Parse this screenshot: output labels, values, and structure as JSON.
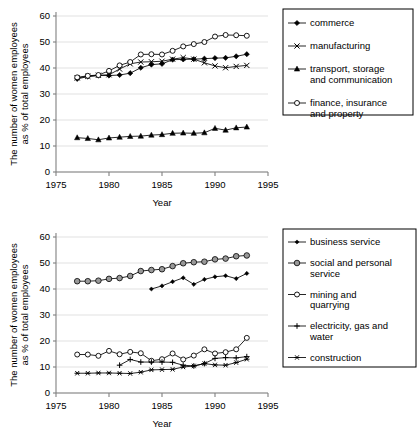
{
  "figure": {
    "axis": {
      "ylabel_line1": "The number of women employees",
      "ylabel_line2": "as % of total employees",
      "xlabel": "Year",
      "yticks": [
        "0",
        "10",
        "20",
        "30",
        "40",
        "50",
        "60"
      ],
      "xticks": [
        "1975",
        "1980",
        "1985",
        "1990",
        "1995"
      ],
      "ylim": [
        0,
        60
      ],
      "xlim": [
        1975,
        1995
      ]
    },
    "colors": {
      "line": "#000000",
      "grid": "#d9d9d9",
      "axis": "#808080",
      "gray_marker": "#999999",
      "open_marker": "#ffffff",
      "legend_border": "#000000"
    }
  },
  "chart_data": [
    {
      "type": "line",
      "title": "",
      "xlabel": "Year",
      "ylabel": "The number of women employees as % of total employees",
      "xlim": [
        1975,
        1995
      ],
      "ylim": [
        0,
        60
      ],
      "grid": true,
      "legend_position": "right",
      "x": [
        1977,
        1978,
        1979,
        1980,
        1981,
        1982,
        1983,
        1984,
        1985,
        1986,
        1987,
        1988,
        1989,
        1990,
        1991,
        1992,
        1993
      ],
      "series": [
        {
          "name": "commerce",
          "marker": "filled-diamond",
          "values": [
            35.8,
            36.7,
            37.1,
            37.1,
            37.3,
            38.0,
            40.1,
            41.3,
            41.6,
            43.2,
            43.3,
            43.4,
            43.6,
            43.8,
            43.9,
            44.5,
            45.3
          ]
        },
        {
          "name": "manufacturing",
          "marker": "cross-x",
          "values": [
            36.2,
            36.8,
            37.2,
            37.4,
            39.6,
            41.6,
            42.3,
            42.4,
            42.6,
            43.4,
            44.0,
            43.4,
            42.0,
            40.8,
            40.1,
            40.6,
            41.0
          ]
        },
        {
          "name": "transport, storage and communication",
          "marker": "filled-triangle",
          "values": [
            13.2,
            12.9,
            12.4,
            13.1,
            13.4,
            13.7,
            13.8,
            14.2,
            14.4,
            14.9,
            15.0,
            14.9,
            15.1,
            16.8,
            16.1,
            17.0,
            17.3
          ]
        },
        {
          "name": "finance, insurance and property",
          "marker": "open-circle",
          "values": [
            36.4,
            37.0,
            37.3,
            38.9,
            41.0,
            42.3,
            45.2,
            45.3,
            45.2,
            46.6,
            48.3,
            49.2,
            50.0,
            52.1,
            52.7,
            52.6,
            52.4
          ]
        }
      ]
    },
    {
      "type": "line",
      "title": "",
      "xlabel": "Year",
      "ylabel": "The number of women employees as % of total employees",
      "xlim": [
        1975,
        1995
      ],
      "ylim": [
        0,
        60
      ],
      "grid": true,
      "legend_position": "right",
      "x": [
        1977,
        1978,
        1979,
        1980,
        1981,
        1982,
        1983,
        1984,
        1985,
        1986,
        1987,
        1988,
        1989,
        1990,
        1991,
        1992,
        1993
      ],
      "series": [
        {
          "name": "business service",
          "marker": "small-filled-diamond",
          "values": [
            null,
            null,
            null,
            null,
            null,
            null,
            null,
            40.0,
            41.2,
            42.8,
            44.3,
            41.8,
            43.7,
            44.7,
            45.1,
            44.0,
            46.0
          ]
        },
        {
          "name": "social and personal service",
          "marker": "gray-filled-circle",
          "values": [
            43.0,
            43.0,
            43.2,
            43.9,
            44.2,
            45.0,
            46.9,
            47.3,
            47.6,
            48.8,
            49.9,
            50.3,
            50.5,
            51.4,
            51.7,
            52.6,
            52.9
          ]
        },
        {
          "name": "mining and quarrying",
          "marker": "open-circle",
          "values": [
            14.8,
            14.8,
            14.3,
            16.2,
            14.9,
            15.8,
            15.3,
            12.4,
            13.0,
            15.2,
            12.9,
            14.4,
            16.8,
            15.2,
            15.7,
            16.8,
            21.2
          ]
        },
        {
          "name": "electricity, gas and water",
          "marker": "plus",
          "values": [
            null,
            null,
            null,
            null,
            10.7,
            12.9,
            11.9,
            11.9,
            11.9,
            11.8,
            10.7,
            10.4,
            11.3,
            13.3,
            13.6,
            13.5,
            14.0
          ]
        },
        {
          "name": "construction",
          "marker": "asterisk",
          "values": [
            7.6,
            7.6,
            7.7,
            7.7,
            7.6,
            7.5,
            8.0,
            8.9,
            9.0,
            9.1,
            10.0,
            10.4,
            11.3,
            10.8,
            10.7,
            11.7,
            13.0
          ]
        }
      ]
    }
  ],
  "legends": [
    {
      "items": [
        {
          "label": "commerce",
          "marker": "filled-diamond"
        },
        {
          "label": "manufacturing",
          "marker": "cross-x"
        },
        {
          "label_line1": "transport, storage",
          "label_line2": "and communication",
          "marker": "filled-triangle"
        },
        {
          "label_line1": "finance, insurance",
          "label_line2": "and property",
          "marker": "open-circle"
        }
      ]
    },
    {
      "items": [
        {
          "label": "business service",
          "marker": "small-filled-diamond"
        },
        {
          "label_line1": "social and personal",
          "label_line2": "service",
          "marker": "gray-filled-circle"
        },
        {
          "label_line1": "mining and",
          "label_line2": "quarrying",
          "marker": "open-circle"
        },
        {
          "label_line1": "electricity, gas and",
          "label_line2": "water",
          "marker": "plus"
        },
        {
          "label": "construction",
          "marker": "asterisk"
        }
      ]
    }
  ]
}
